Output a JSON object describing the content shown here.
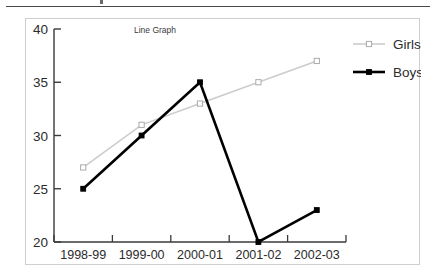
{
  "page": {
    "background_color": "#ffffff",
    "rule_color": "#4a4a4a",
    "box_border_color": "#cfcfcf"
  },
  "chart_data": {
    "type": "line",
    "title": "Line Graph",
    "xlabel": "",
    "ylabel": "",
    "categories": [
      "1998-99",
      "1999-00",
      "2000-01",
      "2001-02",
      "2002-03"
    ],
    "series": [
      {
        "name": "Girls",
        "values": [
          27,
          31,
          33,
          35,
          37
        ],
        "color": "#cccccc",
        "marker": "open-square",
        "line_width": 1.6
      },
      {
        "name": "Boys",
        "values": [
          25,
          30,
          35,
          20,
          23
        ],
        "color": "#000000",
        "marker": "filled-square",
        "line_width": 2.6
      }
    ],
    "ylim": [
      20,
      40
    ],
    "yticks": [
      20,
      25,
      30,
      35,
      40
    ],
    "ytick_labels": [
      "20",
      "25",
      "30",
      "35",
      "40"
    ],
    "grid": false,
    "legend_position": "right"
  }
}
